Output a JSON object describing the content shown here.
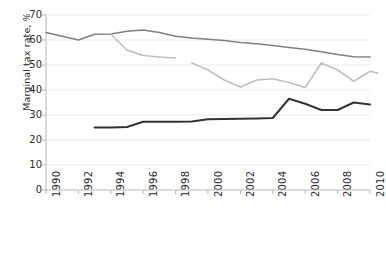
{
  "chart_data": {
    "type": "line",
    "title": "",
    "xlabel": "",
    "ylabel": "Marginal tax rate, %",
    "ylabel_text": "Marginal tax rate, ",
    "ylabel_unit": "%",
    "xlim": [
      1990,
      2010
    ],
    "ylim": [
      0,
      70
    ],
    "yticks": [
      0,
      10,
      20,
      30,
      40,
      50,
      60,
      70
    ],
    "xticks": [
      1990,
      1992,
      1994,
      1996,
      1998,
      2000,
      2002,
      2004,
      2006,
      2008,
      2010
    ],
    "grid": "horizontal",
    "legend": "none",
    "series": [
      {
        "name": "top-line",
        "color": "#808080",
        "width": 1.6,
        "points": [
          [
            1990,
            63.0
          ],
          [
            1991,
            61.5
          ],
          [
            1992,
            60.0
          ],
          [
            1993,
            62.3
          ],
          [
            1994,
            62.4
          ],
          [
            1995,
            63.5
          ],
          [
            1996,
            64.0
          ],
          [
            1997,
            63.0
          ],
          [
            1998,
            61.5
          ],
          [
            1999,
            60.8
          ],
          [
            2000,
            60.3
          ],
          [
            2001,
            59.8
          ],
          [
            2002,
            59.0
          ],
          [
            2003,
            58.5
          ],
          [
            2004,
            57.8
          ],
          [
            2005,
            57.0
          ],
          [
            2006,
            56.3
          ],
          [
            2007,
            55.3
          ],
          [
            2008,
            54.2
          ],
          [
            2009,
            53.3
          ],
          [
            2010,
            53.2
          ]
        ]
      },
      {
        "name": "middle-line",
        "color": "#bfbfbf",
        "width": 1.6,
        "segments": [
          [
            [
              1994,
              62.3
            ],
            [
              1995,
              56.0
            ],
            [
              1996,
              53.8
            ],
            [
              1997,
              53.2
            ],
            [
              1998,
              52.8
            ]
          ],
          [
            [
              1999,
              50.8
            ],
            [
              2000,
              48.0
            ],
            [
              2001,
              44.0
            ],
            [
              2002,
              41.2
            ],
            [
              2003,
              44.0
            ],
            [
              2004,
              44.5
            ],
            [
              2005,
              43.0
            ],
            [
              2006,
              41.0
            ],
            [
              2007,
              50.8
            ],
            [
              2008,
              48.0
            ],
            [
              2009,
              43.5
            ],
            [
              2010,
              47.5
            ],
            [
              2011,
              46.0
            ]
          ]
        ]
      },
      {
        "name": "bottom-line",
        "color": "#333333",
        "width": 2.0,
        "points": [
          [
            1993,
            25.0
          ],
          [
            1994,
            25.0
          ],
          [
            1995,
            25.2
          ],
          [
            1996,
            27.3
          ],
          [
            1997,
            27.3
          ],
          [
            1998,
            27.3
          ],
          [
            1999,
            27.4
          ],
          [
            2000,
            28.3
          ],
          [
            2001,
            28.4
          ],
          [
            2002,
            28.5
          ],
          [
            2003,
            28.6
          ],
          [
            2004,
            28.8
          ],
          [
            2005,
            36.5
          ],
          [
            2006,
            34.5
          ],
          [
            2007,
            32.0
          ],
          [
            2008,
            32.0
          ],
          [
            2009,
            35.0
          ],
          [
            2010,
            34.2
          ]
        ]
      }
    ]
  },
  "axis": {
    "y_title": "Marginal tax rate, ",
    "y_unit": "%"
  }
}
